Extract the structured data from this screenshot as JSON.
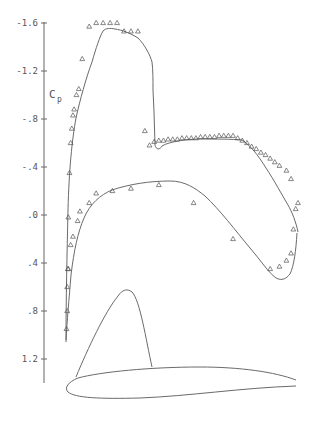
{
  "chart_data": {
    "type": "line",
    "title": "",
    "xlabel": "x/c",
    "ylabel": "Cp",
    "ylabel_main": "C",
    "ylabel_sub": "p",
    "y_inverted": true,
    "ylim": [
      -1.6,
      1.2
    ],
    "xlim": [
      0,
      1
    ],
    "grid": false,
    "yticks": [
      {
        "value": -1.6,
        "label": "-1.6"
      },
      {
        "value": -1.2,
        "label": "-1.2"
      },
      {
        "value": -0.8,
        "label": "-.8"
      },
      {
        "value": -0.4,
        "label": "-.4"
      },
      {
        "value": 0.0,
        "label": ".0"
      },
      {
        "value": 0.4,
        "label": ".4"
      },
      {
        "value": 0.8,
        "label": ".8"
      },
      {
        "value": 1.2,
        "label": "1.2"
      }
    ],
    "series": [
      {
        "name": "Upper surface (computed)",
        "style": "line",
        "x": [
          0.0,
          0.005,
          0.01,
          0.02,
          0.03,
          0.05,
          0.07,
          0.1,
          0.12,
          0.15,
          0.2,
          0.25,
          0.3,
          0.33,
          0.34,
          0.345,
          0.36,
          0.38,
          0.45,
          0.55,
          0.65,
          0.72,
          0.8,
          0.9,
          0.96,
          1.0
        ],
        "values": [
          1.05,
          0.5,
          -0.1,
          -0.6,
          -0.8,
          -1.1,
          -1.35,
          -1.55,
          -1.57,
          -1.57,
          -1.53,
          -1.45,
          -1.25,
          -0.95,
          -0.72,
          -0.58,
          -0.6,
          -0.62,
          -0.65,
          -0.66,
          -0.66,
          -0.65,
          -0.55,
          -0.33,
          -0.15,
          -0.08
        ]
      },
      {
        "name": "Lower surface (computed)",
        "style": "line",
        "x": [
          0.0,
          0.005,
          0.01,
          0.02,
          0.04,
          0.06,
          0.1,
          0.15,
          0.2,
          0.3,
          0.4,
          0.5,
          0.6,
          0.7,
          0.8,
          0.85,
          0.9,
          0.94,
          0.97,
          1.0
        ],
        "values": [
          1.05,
          0.85,
          0.6,
          0.35,
          0.15,
          0.05,
          -0.1,
          -0.2,
          -0.24,
          -0.27,
          -0.24,
          -0.1,
          0.1,
          0.25,
          0.4,
          0.45,
          0.47,
          0.43,
          0.28,
          -0.08
        ]
      },
      {
        "name": "Upper surface (experiment)",
        "style": "triangle-markers",
        "x": [
          0.002,
          0.005,
          0.008,
          0.01,
          0.015,
          0.02,
          0.025,
          0.03,
          0.035,
          0.045,
          0.055,
          0.07,
          0.1,
          0.13,
          0.16,
          0.19,
          0.22,
          0.25,
          0.28,
          0.31,
          0.34,
          0.36,
          0.38,
          0.4,
          0.42,
          0.44,
          0.46,
          0.48,
          0.5,
          0.52,
          0.54,
          0.56,
          0.58,
          0.6,
          0.62,
          0.64,
          0.66,
          0.68,
          0.7,
          0.72,
          0.74,
          0.76,
          0.78,
          0.8,
          0.82,
          0.84,
          0.86,
          0.88,
          0.9,
          0.92,
          0.95,
          0.97
        ],
        "values": [
          0.95,
          0.8,
          0.45,
          0.02,
          -0.35,
          -0.6,
          -0.72,
          -0.83,
          -0.88,
          -1.0,
          -1.05,
          -1.3,
          -1.57,
          -1.6,
          -1.6,
          -1.6,
          -1.6,
          -1.53,
          -1.53,
          -1.53,
          -0.7,
          -0.58,
          -0.61,
          -0.62,
          -0.62,
          -0.63,
          -0.63,
          -0.63,
          -0.64,
          -0.64,
          -0.64,
          -0.64,
          -0.65,
          -0.65,
          -0.65,
          -0.65,
          -0.66,
          -0.66,
          -0.66,
          -0.66,
          -0.64,
          -0.62,
          -0.6,
          -0.57,
          -0.55,
          -0.52,
          -0.5,
          -0.47,
          -0.44,
          -0.41,
          -0.37,
          -0.3
        ]
      },
      {
        "name": "Lower surface (experiment)",
        "style": "triangle-markers",
        "x": [
          0.005,
          0.01,
          0.02,
          0.03,
          0.05,
          0.06,
          0.1,
          0.13,
          0.2,
          0.28,
          0.4,
          0.55,
          0.72,
          0.88,
          0.92,
          0.95,
          0.97,
          0.98,
          0.99,
          1.0
        ],
        "values": [
          0.6,
          0.45,
          0.25,
          0.18,
          0.05,
          -0.03,
          -0.1,
          -0.18,
          -0.2,
          -0.22,
          -0.25,
          -0.1,
          0.2,
          0.45,
          0.43,
          0.38,
          0.32,
          0.12,
          -0.05,
          -0.1
        ]
      },
      {
        "name": "Airfoil profile",
        "style": "outline",
        "x": [
          0,
          0.1,
          0.3,
          0.5,
          0.7,
          0.9,
          1.0
        ],
        "upper_y_px": [
          372,
          368,
          365,
          366,
          369,
          374,
          378
        ],
        "lower_y_px": [
          380,
          392,
          393,
          390,
          386,
          383,
          381
        ]
      },
      {
        "name": "Boundary layer / shock indicator",
        "style": "outline",
        "x": [
          0.03,
          0.12,
          0.2,
          0.24,
          0.35
        ],
        "values_px": [
          377,
          330,
          291,
          294,
          367
        ]
      }
    ]
  }
}
